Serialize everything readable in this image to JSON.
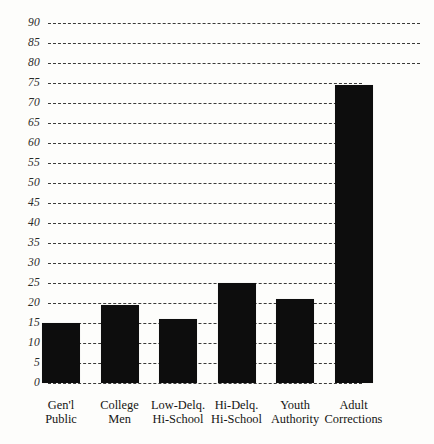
{
  "chart_data": {
    "type": "bar",
    "title": "",
    "subtitle": "",
    "xlabel": "",
    "ylabel": "",
    "ylim": [
      0,
      90
    ],
    "ytick_step": 5,
    "grid": true,
    "grid_style": "dashed-horizontal",
    "legend": "none",
    "bar_color": "#0d0d0d",
    "background_color": "#fdfdfb",
    "categories": [
      "Gen'l Public",
      "College Men",
      "Low-Delq. Hi-School",
      "Hi-Delq. Hi-School",
      "Youth Authority",
      "Adult Corrections"
    ],
    "category_lines": [
      {
        "line1": "Gen'l",
        "line2": "Public"
      },
      {
        "line1": "College",
        "line2": "Men"
      },
      {
        "line1": "Low-Delq.",
        "line2": "Hi-School"
      },
      {
        "line1": "Hi-Delq.",
        "line2": "Hi-School"
      },
      {
        "line1": "Youth",
        "line2": "Authority"
      },
      {
        "line1": "Adult",
        "line2": "Corrections"
      }
    ],
    "values": [
      15,
      19.5,
      16,
      25,
      21,
      74.5
    ],
    "ytick_labels": [
      "90",
      "85",
      "80",
      "75",
      "70",
      "65",
      "60",
      "55",
      "50",
      "45",
      "40",
      "35",
      "30",
      "25",
      "20",
      "15",
      "10",
      "5",
      "0"
    ],
    "ytick_values": [
      90,
      85,
      80,
      75,
      70,
      65,
      60,
      55,
      50,
      45,
      40,
      35,
      30,
      25,
      20,
      15,
      10,
      5,
      0
    ]
  }
}
